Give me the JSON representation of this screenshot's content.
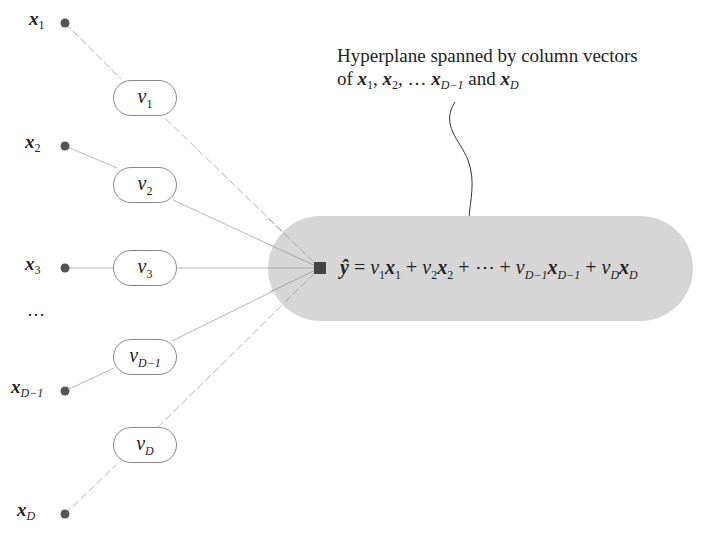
{
  "diagram": {
    "type": "linear-combination network",
    "colors": {
      "background": "#ffffff",
      "node_dot": "#555555",
      "weight_border": "#888888",
      "edge": "#b0b0b0",
      "hyperplane_fill": "#d6d6d6",
      "center_node": "#444444",
      "text": "#222222"
    },
    "inputs": [
      {
        "symbol": "x",
        "sub": "1"
      },
      {
        "symbol": "x",
        "sub": "2"
      },
      {
        "symbol": "x",
        "sub": "3"
      },
      {
        "symbol": "x",
        "sub": "D−1"
      },
      {
        "symbol": "x",
        "sub": "D"
      }
    ],
    "ellipsis": "…",
    "weights": [
      {
        "symbol": "v",
        "sub": "1"
      },
      {
        "symbol": "v",
        "sub": "2"
      },
      {
        "symbol": "v",
        "sub": "3"
      },
      {
        "symbol": "v",
        "sub": "D−1"
      },
      {
        "symbol": "v",
        "sub": "D"
      }
    ],
    "output": {
      "lhs": "ŷ",
      "equals": "=",
      "terms": [
        {
          "v": "v",
          "v_sub": "1",
          "x": "x",
          "x_sub": "1"
        },
        {
          "v": "v",
          "v_sub": "2",
          "x": "x",
          "x_sub": "2"
        },
        {
          "v": "v",
          "v_sub": "D−1",
          "x": "x",
          "x_sub": "D−1"
        },
        {
          "v": "v",
          "v_sub": "D",
          "x": "x",
          "x_sub": "D"
        }
      ],
      "plus": "+",
      "cdots": "⋯"
    },
    "annotation": {
      "line1": "Hyperplane spanned by column vectors",
      "line2_prefix": "of",
      "line2_x": "x",
      "line2_subs": [
        "1",
        "2",
        "D−1",
        "D"
      ],
      "line2_sep": ",",
      "line2_ellipsis": "…",
      "line2_and": "and"
    }
  }
}
